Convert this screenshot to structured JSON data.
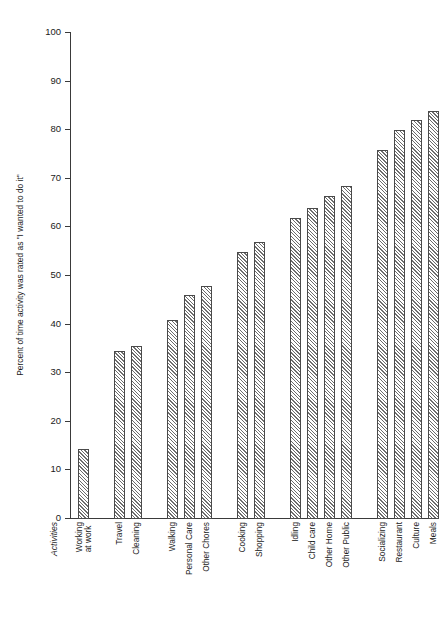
{
  "chart_data": {
    "type": "bar",
    "title": "",
    "subtitle": "",
    "xlabel": "Activities",
    "ylabel": "Percent of time activity was rated as \"I wanted to do it\"",
    "ylim": [
      0,
      100
    ],
    "ytick_labels": [
      "100",
      "90",
      "80",
      "70",
      "60",
      "50",
      "40",
      "30",
      "20",
      "10",
      "0"
    ],
    "ytick_values": [
      100,
      90,
      80,
      70,
      60,
      50,
      40,
      30,
      20,
      10,
      0
    ],
    "grid": false,
    "legend": "none",
    "orientation": "vertical",
    "bar_fill": "diagonal-hatch",
    "categories": [
      "Working at work",
      "Travel",
      "Cleaning",
      "Walking",
      "Personal Care",
      "Other Chores",
      "Cooking",
      "Shopping",
      "Idling",
      "Child care",
      "Other Home",
      "Other Public",
      "Socializing",
      "Restaurant",
      "Culture",
      "Meals",
      "TV Watching",
      "Reading",
      "Sports, Games"
    ],
    "values": [
      14.5,
      34.5,
      35.5,
      41,
      46,
      48,
      55,
      57,
      62,
      64,
      66.5,
      68.5,
      76,
      80,
      82,
      84,
      85.5,
      86.5,
      90
    ],
    "groups": [
      {
        "name": "group-1",
        "count": 1
      },
      {
        "name": "group-2",
        "count": 2
      },
      {
        "name": "group-3",
        "count": 3
      },
      {
        "name": "group-4",
        "count": 2
      },
      {
        "name": "group-5",
        "count": 4
      },
      {
        "name": "group-6",
        "count": 6
      },
      {
        "name": "group-7",
        "count": 1
      }
    ]
  },
  "labels": {
    "bar_0": "Working\nat work",
    "bar_1": "Travel",
    "bar_2": "Cleaning",
    "bar_3": "Walking",
    "bar_4": "Personal Care",
    "bar_5": "Other Chores",
    "bar_6": "Cooking",
    "bar_7": "Shopping",
    "bar_8": "Idling",
    "bar_9": "Child care",
    "bar_10": "Other Home",
    "bar_11": "Other Public",
    "bar_12": "Socializing",
    "bar_13": "Restaurant",
    "bar_14": "Culture",
    "bar_15": "Meals",
    "bar_16": "TV Watching",
    "bar_17": "Reading",
    "bar_18": "Sports, Games"
  },
  "colors": {
    "axis": "#3a3a3a",
    "bar_edge": "#4a4a4a",
    "hatch": "#6d6d6d",
    "background": "#ffffff",
    "text": "#1a1a1a"
  }
}
